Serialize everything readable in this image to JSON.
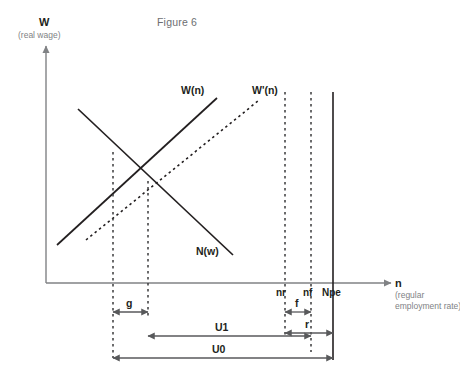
{
  "figure": {
    "title": "Figure 6",
    "y_axis": {
      "name": "W",
      "description": "(real wage)"
    },
    "x_axis": {
      "name": "n",
      "description_line1": "(regular",
      "description_line2": "employment rate)"
    },
    "curves": [
      {
        "id": "wage-curve",
        "label": "W(n)",
        "style": "solid",
        "slope": "upward"
      },
      {
        "id": "wage-curve-shifted",
        "label": "W'(n)",
        "style": "dashed",
        "slope": "upward"
      },
      {
        "id": "labour-demand-curve",
        "label": "N(w)",
        "style": "solid",
        "slope": "downward"
      }
    ],
    "tick_labels": [
      {
        "id": "nr",
        "label": "nr"
      },
      {
        "id": "nf",
        "label": "nf"
      },
      {
        "id": "npe",
        "label": "Npe"
      }
    ],
    "measure_labels": [
      {
        "id": "g",
        "label": "g"
      },
      {
        "id": "f",
        "label": "f"
      },
      {
        "id": "r",
        "label": "r"
      },
      {
        "id": "u1",
        "label": "U1"
      },
      {
        "id": "u0",
        "label": "U0"
      }
    ],
    "colors": {
      "curve": "#231f20",
      "axis": "#808285",
      "guide": "#58595b",
      "muted_text": "#6d6e71"
    }
  }
}
